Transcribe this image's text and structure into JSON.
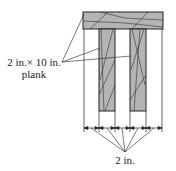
{
  "diagram": {
    "plank_label_line1": "2 in.× 10 in.",
    "plank_label_line2": "plank",
    "dimension_label": "2 in.",
    "colors": {
      "wood": "#b4b4b4",
      "line": "#222222",
      "background": "#ffffff"
    },
    "segments": 6
  }
}
